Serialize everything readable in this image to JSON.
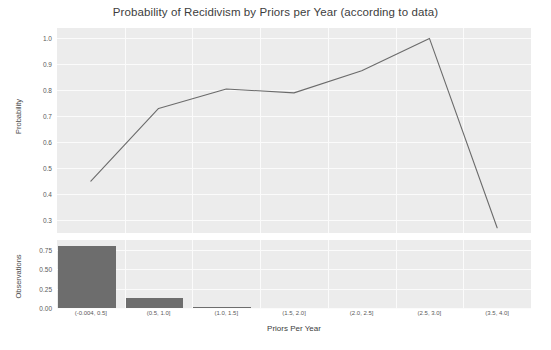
{
  "chart_data": {
    "type": "line",
    "title": "Probability of Recidivism by Priors per Year (according to data)",
    "xlabel": "Priors Per Year",
    "grid": true,
    "legend": "none",
    "panels": [
      {
        "name": "probability-panel",
        "type": "line",
        "ylabel": "Probability",
        "ylim": [
          0.25,
          1.04
        ],
        "yticks": [
          "1.0",
          "0.9",
          "0.8",
          "0.7",
          "0.6",
          "0.5",
          "0.4",
          "0.3"
        ],
        "ytick_values": [
          1.0,
          0.9,
          0.8,
          0.7,
          0.6,
          0.5,
          0.4,
          0.3
        ],
        "categories": [
          "(-0.004, 0.5]",
          "(0.5, 1.0]",
          "(1.0, 1.5]",
          "(1.5, 2.0]",
          "(2.0, 2.5]",
          "(2.5, 3.0]",
          "(3.5, 4.0]"
        ],
        "values": [
          0.45,
          0.73,
          0.805,
          0.79,
          0.875,
          1.0,
          0.27
        ],
        "line_color": "#6b6b6b"
      },
      {
        "name": "observations-panel",
        "type": "bar",
        "ylabel": "Observations",
        "ylim": [
          0.0,
          0.88
        ],
        "yticks": [
          "0.75",
          "0.50",
          "0.25",
          "0.00"
        ],
        "ytick_values": [
          0.75,
          0.5,
          0.25,
          0.0
        ],
        "categories": [
          "(-0.004, 0.5]",
          "(0.5, 1.0]",
          "(1.0, 1.5]",
          "(1.5, 2.0]",
          "(2.0, 2.5]",
          "(2.5, 3.0]",
          "(3.5, 4.0]"
        ],
        "values": [
          0.805,
          0.13,
          0.012,
          0.0,
          0.0,
          0.0,
          0.0
        ],
        "bar_color": "#6d6d6d"
      }
    ]
  },
  "figure": {
    "title": "Probability of Recidivism by Priors per Year (according to data)",
    "xaxis_title": "Priors Per Year",
    "line_panel_ylabel": "Probability",
    "bar_panel_ylabel": "Observations",
    "background_color": "#ececec",
    "gridline_color": "#fbfbfb"
  }
}
